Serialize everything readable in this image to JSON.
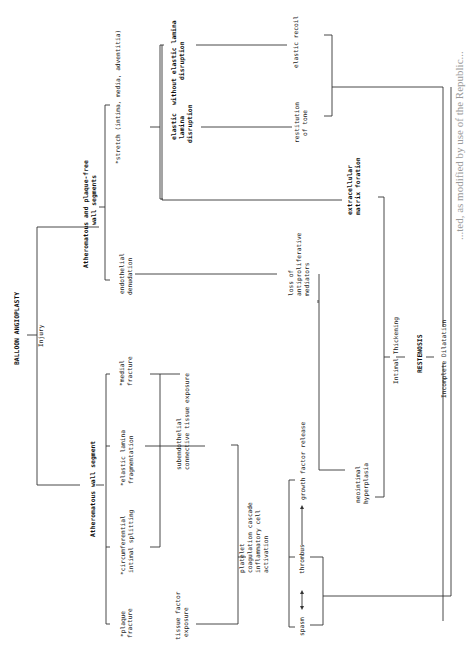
{
  "diagram": {
    "title": "BALLOON ANGIOPLASTY",
    "orientation": "rotated 90 degrees counter-clockwise",
    "nodes": {
      "injury": "Injury",
      "atheromatous_wall_segment": "Atheromatous wall segment",
      "atheromatous_plaque_free": [
        "Atheromatous and plaque-free",
        "wall segments"
      ],
      "plaque_fracture": [
        "*plaque",
        "fracture"
      ],
      "circumferential_splitting": [
        "*circumferential",
        "intimal splitting"
      ],
      "elastic_lamina_fragmentation": [
        "*elastic lamina",
        "fragmentation"
      ],
      "medial_fracture": [
        "*medial",
        "fracture"
      ],
      "endothelial_denudation": [
        "endothelial",
        "denudation"
      ],
      "stretch": "*stretch (intima, media, adventitia)",
      "elastic_lamina_disruption": [
        "elastic",
        "lamina",
        "disruption"
      ],
      "without_elastic_lamina_disruption": [
        "without elastic lamina",
        "disruption"
      ],
      "tissue_factor_exposure": [
        "tissue factor",
        "exposure"
      ],
      "subendothelial_exposure": [
        "subendothelial",
        "connective tissue exposure"
      ],
      "platelet_cascade": [
        "platelet",
        "coagulation cascade",
        "inflammatory cell",
        "activation"
      ],
      "loss_of_mediators": [
        "loss of",
        "antiproliferative",
        "mediators"
      ],
      "restitution_of_tone": [
        "restitution",
        "of tone"
      ],
      "elastic_recoil": "elastic recoil",
      "spasm": "spasm",
      "thrombus": "thrombus",
      "growth_factor_release": "growth factor release",
      "neointimal_hyperplasia": [
        "neointimal",
        "hyperplasia"
      ],
      "extracellular_matrix": [
        "extracellular",
        "matrix foration"
      ],
      "intimal_thickening": "Intimal Thickening",
      "restenosis": "RESTENOSIS",
      "incomplete_dilatation": "Incomplete Dilatation"
    },
    "caption_fragment": "...ted, as modified by use of the Republic..."
  }
}
